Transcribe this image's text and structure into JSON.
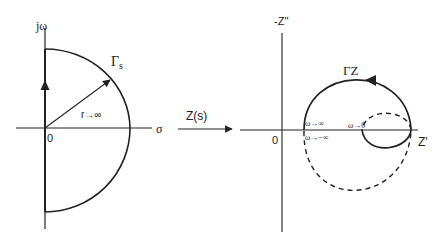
{
  "left_plot": {
    "y_axis_label": "jω",
    "x_axis_label": "σ",
    "origin_label": "0",
    "contour_label_main": "Γ",
    "contour_label_sub": "s",
    "radius_label": "r→∞"
  },
  "mapping": {
    "label": "Z(s)"
  },
  "right_plot": {
    "y_axis_label": "-Z''",
    "x_axis_label": "Z'",
    "origin_label": "0",
    "contour_label": "ΓZ",
    "annotations": {
      "omega_to_inf": "ω→∞",
      "omega_to_neg_inf": "ω→−∞",
      "omega_to_zero": "ω→0"
    }
  },
  "colors": {
    "stroke": "#222222",
    "background": "#ffffff"
  }
}
